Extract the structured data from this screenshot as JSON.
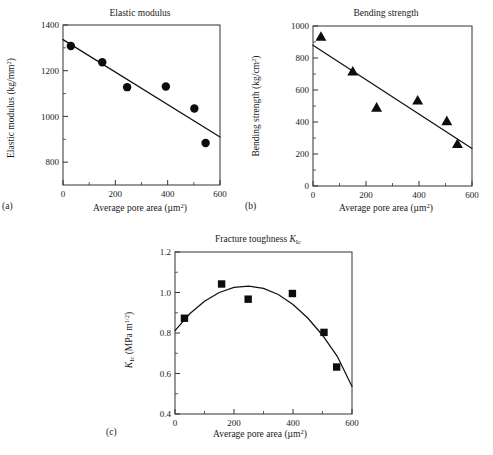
{
  "figure": {
    "panel_labels": {
      "a": "(a)",
      "b": "(b)",
      "c": "(c)"
    },
    "shared_xlabel_main": "Average pore area (",
    "shared_xlabel_unit": "μm",
    "shared_xlabel_sup": "2",
    "shared_xlabel_close": ")"
  },
  "chart_data": [
    {
      "id": "panel-a",
      "panel": "(a)",
      "type": "scatter",
      "title": "Elastic modulus",
      "xlabel": "Average pore area (μm²)",
      "ylabel": "Elastic modulus (kg/mm²)",
      "ylabel_parts": {
        "main": "Elastic modulus (kg/mm",
        "sup": "2",
        "close": ")"
      },
      "marker": "circle",
      "xlim": [
        0,
        600
      ],
      "ylim": [
        700,
        1400
      ],
      "xticks": [
        0,
        200,
        400,
        600
      ],
      "xtick_labels": [
        "0",
        "200",
        "400",
        "600"
      ],
      "x_minor_ticks": [
        100,
        300,
        500
      ],
      "yticks": [
        800,
        1000,
        1200,
        1400
      ],
      "ytick_labels": [
        "800",
        "1000",
        "1200",
        "1400"
      ],
      "y_minor_ticks": [
        900,
        1100,
        1300
      ],
      "grid": false,
      "legend": "none",
      "points": [
        {
          "x": 30,
          "y": 1308
        },
        {
          "x": 150,
          "y": 1237
        },
        {
          "x": 245,
          "y": 1128
        },
        {
          "x": 393,
          "y": 1131
        },
        {
          "x": 502,
          "y": 1035
        },
        {
          "x": 545,
          "y": 884
        }
      ],
      "fit": {
        "type": "linear",
        "x": [
          0,
          600
        ],
        "y": [
          1336,
          910
        ]
      }
    },
    {
      "id": "panel-b",
      "panel": "(b)",
      "type": "scatter",
      "title": "Bending strength",
      "xlabel": "Average pore area (μm²)",
      "ylabel": "Bending strength (kg/cm²)",
      "ylabel_parts": {
        "main": "Bending strength (kg/cm",
        "sup": "2",
        "close": ")"
      },
      "marker": "triangle",
      "xlim": [
        0,
        600
      ],
      "ylim": [
        0,
        1000
      ],
      "xticks": [
        0,
        200,
        400,
        600
      ],
      "xtick_labels": [
        "0",
        "200",
        "400",
        "600"
      ],
      "x_minor_ticks": [
        100,
        300,
        500
      ],
      "yticks": [
        0,
        200,
        400,
        600,
        800,
        1000
      ],
      "ytick_labels": [
        "0",
        "200",
        "400",
        "600",
        "800",
        "1000"
      ],
      "y_minor_ticks": [
        100,
        300,
        500,
        700,
        900
      ],
      "grid": false,
      "legend": "none",
      "points": [
        {
          "x": 30,
          "y": 935
        },
        {
          "x": 150,
          "y": 718
        },
        {
          "x": 240,
          "y": 492
        },
        {
          "x": 395,
          "y": 537
        },
        {
          "x": 505,
          "y": 408
        },
        {
          "x": 545,
          "y": 265
        }
      ],
      "fit": {
        "type": "linear",
        "x": [
          0,
          600
        ],
        "y": [
          880,
          235
        ]
      }
    },
    {
      "id": "panel-c",
      "panel": "(c)",
      "type": "scatter",
      "title_main": "Fracture toughness ",
      "title_symbol": "K",
      "title_sub": "Ic",
      "title": "Fracture toughness K_Ic",
      "xlabel": "Average pore area (μm²)",
      "ylabel": "K_Ic (MPa m^1/2)",
      "ylabel_parts": {
        "symbol": "K",
        "sub": "Ic",
        "mid": " (MPa m",
        "sup": "1/2",
        "close": ")"
      },
      "marker": "square",
      "xlim": [
        0,
        600
      ],
      "ylim": [
        0.4,
        1.2
      ],
      "xticks": [
        0,
        200,
        400,
        600
      ],
      "xtick_labels": [
        "0",
        "200",
        "400",
        "600"
      ],
      "x_minor_ticks": [
        100,
        300,
        500
      ],
      "yticks": [
        0.4,
        0.6,
        0.8,
        1.0,
        1.2
      ],
      "ytick_labels": [
        "0.4",
        "0.6",
        "0.8",
        "1.0",
        "1.2"
      ],
      "y_minor_ticks": [
        0.5,
        0.7,
        0.9,
        1.1
      ],
      "grid": false,
      "legend": "none",
      "points": [
        {
          "x": 32,
          "y": 0.873
        },
        {
          "x": 158,
          "y": 1.042
        },
        {
          "x": 248,
          "y": 0.967
        },
        {
          "x": 398,
          "y": 0.995
        },
        {
          "x": 505,
          "y": 0.803
        },
        {
          "x": 548,
          "y": 0.632
        }
      ],
      "fit": {
        "type": "quadratic",
        "curve": [
          {
            "x": 0,
            "y": 0.812
          },
          {
            "x": 50,
            "y": 0.895
          },
          {
            "x": 100,
            "y": 0.957
          },
          {
            "x": 150,
            "y": 1.0
          },
          {
            "x": 200,
            "y": 1.025
          },
          {
            "x": 250,
            "y": 1.032
          },
          {
            "x": 300,
            "y": 1.02
          },
          {
            "x": 350,
            "y": 0.99
          },
          {
            "x": 400,
            "y": 0.941
          },
          {
            "x": 450,
            "y": 0.874
          },
          {
            "x": 500,
            "y": 0.789
          },
          {
            "x": 550,
            "y": 0.685
          },
          {
            "x": 600,
            "y": 0.536
          }
        ]
      }
    }
  ]
}
